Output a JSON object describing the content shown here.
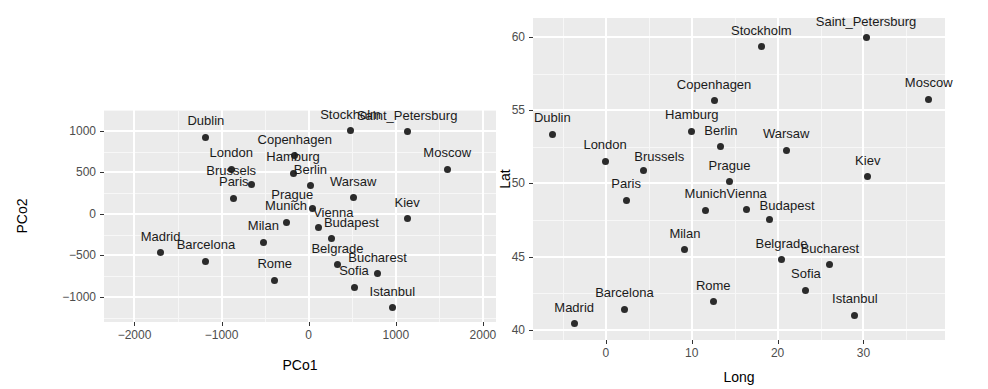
{
  "figure": {
    "background": "#ffffff",
    "panel_background": "#ebebeb",
    "gridline_color": "#ffffff",
    "point_color": "#2b2b2b",
    "label_color": "#1a1a1a",
    "tick_color": "#4d4d4d"
  },
  "chart_data": [
    {
      "type": "scatter",
      "id": "pcoa-plot",
      "title": "",
      "xlabel": "PCo1",
      "ylabel": "PCo2",
      "xlim": [
        -2350,
        2150
      ],
      "ylim": [
        -1300,
        1250
      ],
      "xticks": [
        -2000,
        -1000,
        0,
        1000,
        2000
      ],
      "xticklabels": [
        "-2000",
        "-1000",
        "0",
        "1000",
        "2000"
      ],
      "yticks": [
        -1000,
        -500,
        0,
        500,
        1000
      ],
      "yticklabels": [
        "-1000",
        "-500",
        "0",
        "500",
        "1000"
      ],
      "grid": true,
      "legend": "none",
      "points": [
        {
          "label": "Dublin",
          "x": -1180,
          "y": 920,
          "label_dx": 0,
          "label_dy": -10
        },
        {
          "label": "Stockholm",
          "x": 480,
          "y": 1000,
          "label_dx": 0,
          "label_dy": -10
        },
        {
          "label": "Saint_Petersburg",
          "x": 1130,
          "y": 990,
          "label_dx": 0,
          "label_dy": -10
        },
        {
          "label": "Copenhagen",
          "x": -160,
          "y": 700,
          "label_dx": 0,
          "label_dy": -10
        },
        {
          "label": "Moscow",
          "x": 1590,
          "y": 540,
          "label_dx": 0,
          "label_dy": -10
        },
        {
          "label": "London",
          "x": -890,
          "y": 540,
          "label_dx": 0,
          "label_dy": -10
        },
        {
          "label": "Hamburg",
          "x": -180,
          "y": 490,
          "label_dx": 0,
          "label_dy": -10
        },
        {
          "label": "Brussels",
          "x": -660,
          "y": 350,
          "label_dx": -20,
          "label_dy": -8
        },
        {
          "label": "Berlin",
          "x": 20,
          "y": 340,
          "label_dx": 0,
          "label_dy": -10
        },
        {
          "label": "Paris",
          "x": -860,
          "y": 190,
          "label_dx": 0,
          "label_dy": -10
        },
        {
          "label": "Warsaw",
          "x": 510,
          "y": 195,
          "label_dx": 0,
          "label_dy": -10
        },
        {
          "label": "Prague",
          "x": 40,
          "y": 60,
          "label_dx": -20,
          "label_dy": -8
        },
        {
          "label": "Kiev",
          "x": 1130,
          "y": -60,
          "label_dx": 0,
          "label_dy": -10
        },
        {
          "label": "Munich",
          "x": -260,
          "y": -100,
          "label_dx": 0,
          "label_dy": -10
        },
        {
          "label": "Vienna",
          "x": 110,
          "y": -160,
          "label_dx": 15,
          "label_dy": -8
        },
        {
          "label": "Budapest",
          "x": 260,
          "y": -300,
          "label_dx": 20,
          "label_dy": -10
        },
        {
          "label": "Milan",
          "x": -520,
          "y": -340,
          "label_dx": 0,
          "label_dy": -10
        },
        {
          "label": "Madrid",
          "x": -1700,
          "y": -470,
          "label_dx": 0,
          "label_dy": -10
        },
        {
          "label": "Barcelona",
          "x": -1180,
          "y": -570,
          "label_dx": 0,
          "label_dy": -10
        },
        {
          "label": "Belgrade",
          "x": 330,
          "y": -610,
          "label_dx": 0,
          "label_dy": -10
        },
        {
          "label": "Bucharest",
          "x": 790,
          "y": -720,
          "label_dx": 0,
          "label_dy": -10
        },
        {
          "label": "Rome",
          "x": -390,
          "y": -800,
          "label_dx": 0,
          "label_dy": -10
        },
        {
          "label": "Sofia",
          "x": 520,
          "y": -880,
          "label_dx": 0,
          "label_dy": -10
        },
        {
          "label": "Istanbul",
          "x": 960,
          "y": -1130,
          "label_dx": 0,
          "label_dy": -10
        }
      ]
    },
    {
      "type": "scatter",
      "id": "geo-plot",
      "title": "",
      "xlabel": "Long",
      "ylabel": "Lat",
      "xlim": [
        -8.5,
        39.5
      ],
      "ylim": [
        39.3,
        61.3
      ],
      "xticks": [
        0,
        10,
        20,
        30
      ],
      "xticklabels": [
        "0",
        "10",
        "20",
        "30"
      ],
      "yticks": [
        40,
        45,
        50,
        55,
        60
      ],
      "yticklabels": [
        "40",
        "45",
        "50",
        "55",
        "60"
      ],
      "grid": true,
      "legend": "none",
      "points": [
        {
          "label": "Saint_Petersburg",
          "x": 30.3,
          "y": 59.95,
          "label_dx": 0,
          "label_dy": -10
        },
        {
          "label": "Stockholm",
          "x": 18.1,
          "y": 59.35,
          "label_dx": 0,
          "label_dy": -10
        },
        {
          "label": "Moscow",
          "x": 37.6,
          "y": 55.75,
          "label_dx": 0,
          "label_dy": -10
        },
        {
          "label": "Copenhagen",
          "x": 12.6,
          "y": 55.65,
          "label_dx": 0,
          "label_dy": -10
        },
        {
          "label": "Hamburg",
          "x": 10.0,
          "y": 53.55,
          "label_dx": 0,
          "label_dy": -10
        },
        {
          "label": "Dublin",
          "x": -6.25,
          "y": 53.35,
          "label_dx": 0,
          "label_dy": -10
        },
        {
          "label": "Berlin",
          "x": 13.4,
          "y": 52.5,
          "label_dx": 0,
          "label_dy": -10
        },
        {
          "label": "Warsaw",
          "x": 21.0,
          "y": 52.25,
          "label_dx": 0,
          "label_dy": -10
        },
        {
          "label": "London",
          "x": -0.1,
          "y": 51.5,
          "label_dx": 0,
          "label_dy": -10
        },
        {
          "label": "Brussels",
          "x": 4.35,
          "y": 50.85,
          "label_dx": 16,
          "label_dy": -8
        },
        {
          "label": "Kiev",
          "x": 30.5,
          "y": 50.45,
          "label_dx": 0,
          "label_dy": -10
        },
        {
          "label": "Prague",
          "x": 14.4,
          "y": 50.1,
          "label_dx": 0,
          "label_dy": -10
        },
        {
          "label": "Paris",
          "x": 2.35,
          "y": 48.85,
          "label_dx": 0,
          "label_dy": -10
        },
        {
          "label": "Munich",
          "x": 11.6,
          "y": 48.15,
          "label_dx": 0,
          "label_dy": -10
        },
        {
          "label": "Vienna",
          "x": 16.4,
          "y": 48.2,
          "label_dx": 0,
          "label_dy": -10
        },
        {
          "label": "Budapest",
          "x": 19.0,
          "y": 47.5,
          "label_dx": 18,
          "label_dy": -8
        },
        {
          "label": "Milan",
          "x": 9.2,
          "y": 45.45,
          "label_dx": 0,
          "label_dy": -10
        },
        {
          "label": "Belgrade",
          "x": 20.45,
          "y": 44.8,
          "label_dx": 0,
          "label_dy": -10
        },
        {
          "label": "Bucharest",
          "x": 26.1,
          "y": 44.45,
          "label_dx": 0,
          "label_dy": -10
        },
        {
          "label": "Sofia",
          "x": 23.3,
          "y": 42.7,
          "label_dx": 0,
          "label_dy": -10
        },
        {
          "label": "Rome",
          "x": 12.5,
          "y": 41.9,
          "label_dx": 0,
          "label_dy": -10
        },
        {
          "label": "Barcelona",
          "x": 2.15,
          "y": 41.4,
          "label_dx": 0,
          "label_dy": -10
        },
        {
          "label": "Istanbul",
          "x": 29.0,
          "y": 41.0,
          "label_dx": 0,
          "label_dy": -10
        },
        {
          "label": "Madrid",
          "x": -3.7,
          "y": 40.4,
          "label_dx": 0,
          "label_dy": -10
        }
      ]
    }
  ]
}
